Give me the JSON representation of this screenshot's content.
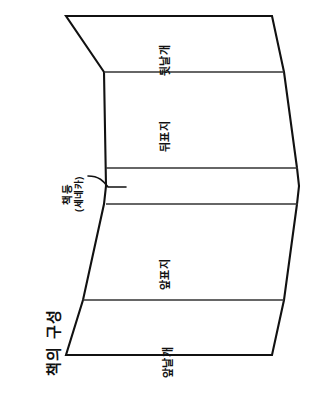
{
  "figure": {
    "title": "책의 구성",
    "ink_color": "#111111",
    "background_color": "#ffffff",
    "fold_line_color": "#333333"
  },
  "panels": [
    {
      "id": "back-flap",
      "label": "뒷날개"
    },
    {
      "id": "back-cover",
      "label": "뒤표지"
    },
    {
      "id": "spine",
      "label": "책등",
      "sublabel": "(세네카)"
    },
    {
      "id": "front-cover",
      "label": "앞표지"
    },
    {
      "id": "front-flap",
      "label": "앞날개"
    }
  ],
  "annotation": {
    "target": "spine",
    "label": "책등",
    "sublabel": "(세네카)",
    "leader_line": true
  }
}
